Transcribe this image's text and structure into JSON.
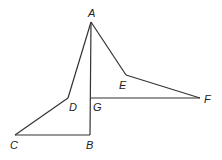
{
  "diagram": {
    "stroke_color": "#333333",
    "points": {
      "A": {
        "x": 91,
        "y": 22,
        "label": "A",
        "lx": 88,
        "ly": 17
      },
      "B": {
        "x": 90,
        "y": 135,
        "label": "B",
        "lx": 86,
        "ly": 149
      },
      "C": {
        "x": 15,
        "y": 135,
        "label": "C",
        "lx": 10,
        "ly": 149
      },
      "D": {
        "x": 68,
        "y": 98,
        "label": "D",
        "lx": 69,
        "ly": 111
      },
      "E": {
        "x": 126,
        "y": 75,
        "label": "E",
        "lx": 119,
        "ly": 89
      },
      "F": {
        "x": 200,
        "y": 98,
        "label": "F",
        "lx": 204,
        "ly": 103
      },
      "G": {
        "x": 90,
        "y": 98,
        "label": "G",
        "lx": 93,
        "ly": 111
      }
    },
    "segments": [
      [
        "A",
        "D"
      ],
      [
        "D",
        "C"
      ],
      [
        "C",
        "B"
      ],
      [
        "B",
        "A"
      ],
      [
        "A",
        "E"
      ],
      [
        "E",
        "F"
      ],
      [
        "F",
        "G"
      ]
    ]
  }
}
